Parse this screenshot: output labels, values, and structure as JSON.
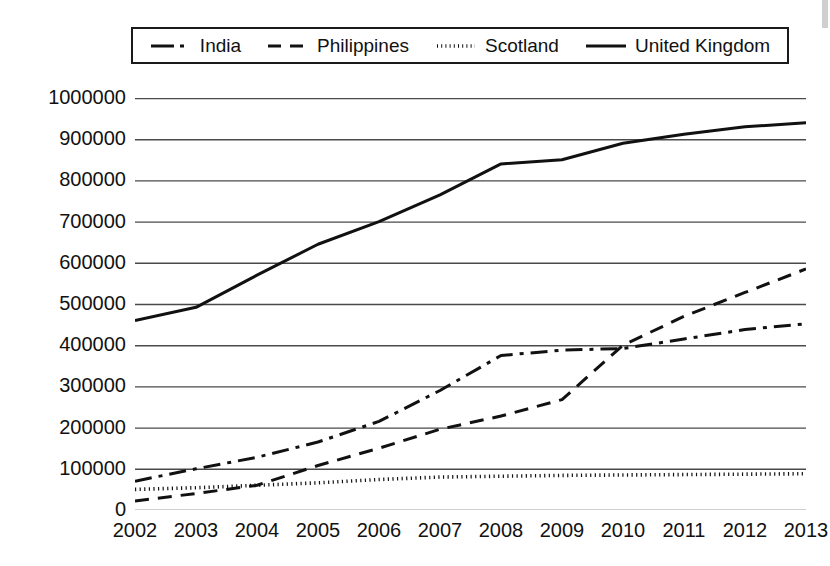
{
  "chart_data": {
    "type": "line",
    "title": "",
    "subtitle": "",
    "xlabel": "",
    "ylabel": "",
    "categories": [
      "2002",
      "2003",
      "2004",
      "2005",
      "2006",
      "2007",
      "2008",
      "2009",
      "2010",
      "2011",
      "2012",
      "2013"
    ],
    "x": [
      2002,
      2003,
      2004,
      2005,
      2006,
      2007,
      2008,
      2009,
      2010,
      2011,
      2012,
      2013
    ],
    "xlim": [
      2002,
      2013
    ],
    "ylim": [
      0,
      1000000
    ],
    "ytick_labels": [
      "1000000",
      "900000",
      "800000",
      "700000",
      "600000",
      "500000",
      "400000",
      "300000",
      "200000",
      "100000",
      "0"
    ],
    "yticks": [
      1000000,
      900000,
      800000,
      700000,
      600000,
      500000,
      400000,
      300000,
      200000,
      100000,
      0
    ],
    "grid": "horizontal",
    "legend_position": "top",
    "series": [
      {
        "name": "India",
        "dash": "dashdot",
        "color": "#111111",
        "values": [
          70000,
          100000,
          128000,
          165000,
          215000,
          290000,
          375000,
          388000,
          392000,
          415000,
          438000,
          452000
        ]
      },
      {
        "name": "Philippines",
        "dash": "dashed",
        "color": "#111111",
        "values": [
          22000,
          40000,
          60000,
          108000,
          150000,
          196000,
          228000,
          268000,
          400000,
          470000,
          528000,
          585000
        ]
      },
      {
        "name": "Scotland",
        "dash": "dotted",
        "color": "#111111",
        "values": [
          50000,
          54000,
          60000,
          66000,
          74000,
          80000,
          82000,
          84000,
          85000,
          86000,
          87000,
          88000
        ]
      },
      {
        "name": "United Kingdom",
        "dash": "solid",
        "color": "#111111",
        "values": [
          460000,
          492000,
          570000,
          645000,
          700000,
          765000,
          840000,
          850000,
          890000,
          912000,
          930000,
          940000
        ]
      }
    ]
  },
  "legend": {
    "items": [
      {
        "label": "India",
        "marker": "dashdot-line-icon"
      },
      {
        "label": "Philippines",
        "marker": "dashed-line-icon"
      },
      {
        "label": "Scotland",
        "marker": "dotted-line-icon"
      },
      {
        "label": "United Kingdom",
        "marker": "solid-line-icon"
      }
    ]
  }
}
